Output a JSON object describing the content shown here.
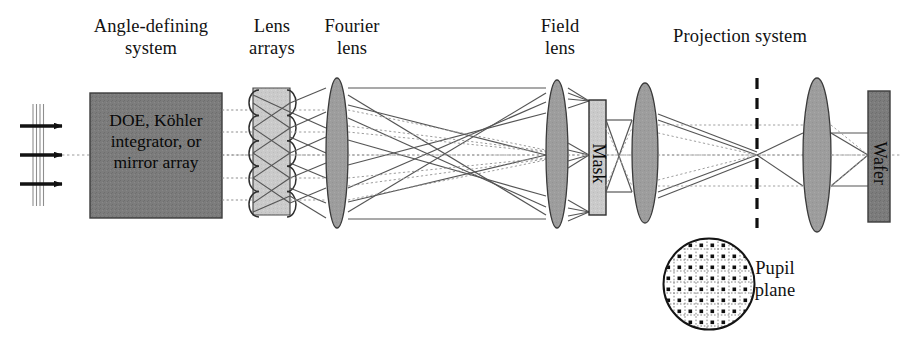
{
  "figure": {
    "width": 922,
    "height": 347,
    "background_color": "#ffffff"
  },
  "colors": {
    "ink": "#111111",
    "dark_box_fill": "#7a7a7a",
    "light_box_fill": "#c9c9c9",
    "lens_fill": "#9a9a9a",
    "ray_solid": "#4a4a4a",
    "ray_dotted": "#8d8d8d",
    "axis": "#9a9a9a",
    "dashed_plane": "#111111"
  },
  "labels": {
    "angle_defining_system": "Angle-defining\nsystem",
    "lens_arrays": "Lens\narrays",
    "fourier_lens": "Fourier\nlens",
    "field_lens": "Field\nlens",
    "projection_system": "Projection system",
    "pupil_plane": "Pupil\nplane"
  },
  "components": {
    "source_arrows": {
      "name": "incoming illumination arrows",
      "count": 3,
      "wavefront_lines": 4
    },
    "doe_box": {
      "label": "DOE, Köhler\nintegrator, or\nmirror array",
      "fill": "#7a7a7a",
      "x": 90,
      "y": 93,
      "width": 132,
      "height": 125
    },
    "lens_array": {
      "label": "Lens arrays",
      "fill": "#c9c9c9",
      "lenslet_count": 5,
      "x": 253,
      "y": 88,
      "width": 37,
      "height": 127
    },
    "fourier_lens": {
      "label": "Fourier lens",
      "fill": "#9a9a9a",
      "cx": 337,
      "cy": 153,
      "rx": 11,
      "ry": 75
    },
    "field_lens": {
      "label": "Field lens",
      "fill": "#9a9a9a",
      "cx": 557,
      "cy": 154,
      "rx": 11,
      "ry": 74
    },
    "mask": {
      "label": "Mask",
      "fill": "#c9c9c9",
      "orientation": "vertical-text",
      "x": 589,
      "y": 100,
      "width": 17,
      "height": 115
    },
    "projection_lens_1": {
      "fill": "#9a9a9a",
      "cx": 645,
      "cy": 153,
      "rx": 13,
      "ry": 70
    },
    "pupil_plane_line": {
      "label": "Pupil plane",
      "style": "dashed-vertical",
      "x": 757,
      "y_top": 78,
      "y_bottom": 228
    },
    "projection_lens_2": {
      "fill": "#9a9a9a",
      "cx": 817,
      "cy": 155,
      "rx": 14,
      "ry": 77
    },
    "wafer": {
      "label": "Wafer",
      "fill": "#7a7a7a",
      "orientation": "vertical-text",
      "x": 868,
      "y": 91,
      "width": 22,
      "height": 131
    },
    "pupil_inset": {
      "name": "pupil fill diagram",
      "shape": "circle with dotted grid and array of dots",
      "cx": 709,
      "cy": 284,
      "r": 46,
      "grid_cells": 8,
      "dot_count": 52
    }
  },
  "optical_axis": {
    "y": 155,
    "style": "dotted"
  }
}
